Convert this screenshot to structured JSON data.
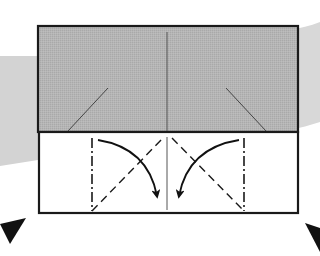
{
  "diagram": {
    "type": "origami-instruction",
    "colors": {
      "background": "#ffffff",
      "swoosh": "#d6d6d6",
      "paper_colored_side": "#b3b3b3",
      "paper_white_side": "#ffffff",
      "outline": "#1a1a1a",
      "crease": "#444444",
      "arrow": "#111111",
      "marker": "#111111"
    },
    "elements": {
      "colored_panel": "Gray (colored side) upper panel",
      "white_strip": "White lower strip",
      "center_crease": "Vertical center crease",
      "upper_left_crease": "Diagonal crease, upper left",
      "upper_right_crease": "Diagonal crease, upper right",
      "left_mountain_fold": "Mountain fold line (dash-dot), left",
      "right_mountain_fold": "Mountain fold line (dash-dot), right",
      "left_valley_fold": "Valley fold line (dashed), left",
      "right_valley_fold": "Valley fold line (dashed), right",
      "left_fold_arrow": "Curved arrow folding left flap inward",
      "right_fold_arrow": "Curved arrow folding right flap inward",
      "left_marker": "Black triangle marker, bottom left",
      "right_marker": "Black triangle marker, bottom right"
    }
  }
}
